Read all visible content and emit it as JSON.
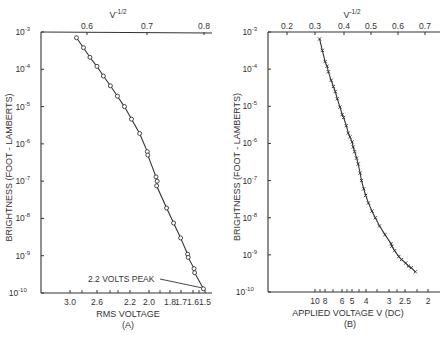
{
  "chart_data": [
    {
      "type": "line",
      "panel": "(A)",
      "title": "",
      "xlabel": "RMS VOLTAGE",
      "x2label": "V^-1/2",
      "ylabel": "BRIGHTNESS (FOOT - LAMBERTS)",
      "yscale": "log",
      "ylim": [
        1e-10,
        0.001
      ],
      "y_ticks": [
        "10-3",
        "10-4",
        "10-5",
        "10-6",
        "10-7",
        "10-8",
        "10-9",
        "10-10"
      ],
      "x_ticks_bottom": [
        "3.0",
        "2.6",
        "2.2",
        "2.0",
        "1.8",
        "1.7",
        "1.6",
        "1.5"
      ],
      "x_ticks_top": [
        "0.6",
        "0.7",
        "0.8"
      ],
      "xlim_top": [
        0.55,
        0.82
      ],
      "marker": "circle",
      "annotation": "2.2 VOLTS PEAK",
      "x": [
        0.582,
        0.594,
        0.605,
        0.617,
        0.628,
        0.64,
        0.652,
        0.664,
        0.676,
        0.69,
        0.703,
        0.704,
        0.718,
        0.72,
        0.719,
        0.736,
        0.748,
        0.76,
        0.772,
        0.773,
        0.783,
        0.784,
        0.799
      ],
      "values": [
        0.0007,
        0.00038,
        0.00021,
        0.00012,
        6.6e-05,
        3.6e-05,
        1.9e-05,
        1e-05,
        4.6e-06,
        1.9e-06,
        6.2e-07,
        5e-07,
        1.3e-07,
        1e-07,
        7.5e-08,
        1.9e-08,
        7.5e-09,
        3e-09,
        1.1e-09,
        9e-10,
        4.5e-10,
        3.5e-10,
        1.3e-10
      ]
    },
    {
      "type": "line",
      "panel": "(B)",
      "title": "",
      "xlabel": "APPLIED VOLTAGE V (DC)",
      "x2label": "V^-1/2",
      "ylabel": "BRIGHTNESS (FOOT - LAMBERTS)",
      "yscale": "log",
      "ylim": [
        1e-10,
        0.001
      ],
      "y_ticks": [
        "10-3",
        "10-4",
        "10-5",
        "10-6",
        "10-7",
        "10-8",
        "10-9",
        "10-10"
      ],
      "x_ticks_bottom": [
        "10",
        "8",
        "6",
        "5",
        "4",
        "3",
        "2.5",
        "2"
      ],
      "x_ticks_top": [
        "0.2",
        "0.3",
        "0.4",
        "0.5",
        "0.6",
        "0.7"
      ],
      "xlim_top": [
        0.14,
        0.72
      ],
      "marker": "x",
      "x": [
        0.318,
        0.328,
        0.338,
        0.345,
        0.35,
        0.36,
        0.368,
        0.375,
        0.382,
        0.392,
        0.4,
        0.405,
        0.415,
        0.422,
        0.428,
        0.436,
        0.44,
        0.445,
        0.452,
        0.458,
        0.465,
        0.47,
        0.478,
        0.485,
        0.495,
        0.508,
        0.52,
        0.535,
        0.555,
        0.577,
        0.58,
        0.59,
        0.605,
        0.615,
        0.63,
        0.64,
        0.65,
        0.665
      ],
      "values": [
        0.00065,
        0.00032,
        0.00016,
        0.00012,
        8.5e-05,
        5e-05,
        3.4e-05,
        2.5e-05,
        1.6e-05,
        9.5e-06,
        6e-06,
        5e-06,
        3e-06,
        1.9e-06,
        1.5e-06,
        1.1e-06,
        8e-07,
        6e-07,
        4e-07,
        2.8e-07,
        1.6e-07,
        1e-07,
        6e-08,
        4e-08,
        2.5e-08,
        1.5e-08,
        1e-08,
        6e-09,
        3.5e-09,
        2e-09,
        1.7e-09,
        1.3e-09,
        9e-10,
        7.5e-10,
        6e-10,
        5e-10,
        4.5e-10,
        3.5e-10
      ]
    }
  ],
  "panelA": {
    "x2label": "V",
    "x2label_sup": "-1/2",
    "xlabel": "RMS VOLTAGE",
    "caption": "(A)",
    "ylabel_1": "BRIGHTNESS",
    "ylabel_2": "(FOOT - LAMBERTS)",
    "annotation": "2.2 VOLTS PEAK"
  },
  "panelB": {
    "x2label": "V",
    "x2label_sup": "-1/2",
    "xlabel": "APPLIED VOLTAGE V (DC)",
    "caption": "(B)",
    "ylabel_1": "BRIGHTNESS",
    "ylabel_2": "(FOOT - LAMBERTS)"
  },
  "colors": {
    "ink": "#333333",
    "background": "#ffffff"
  }
}
